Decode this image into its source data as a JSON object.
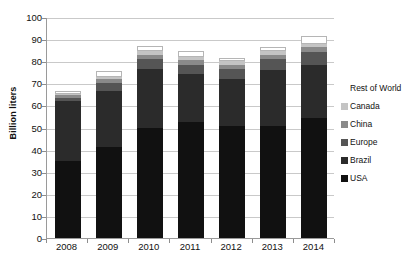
{
  "chart_data": {
    "type": "bar",
    "stacked": true,
    "title": "World Fuel Ethanol Production",
    "xlabel": "",
    "ylabel": "Billion liters",
    "categories": [
      "2008",
      "2009",
      "2010",
      "2011",
      "2012",
      "2013",
      "2014"
    ],
    "ylim": [
      0,
      100
    ],
    "ytick_step": 10,
    "yticks": [
      "0",
      "10",
      "20",
      "30",
      "40",
      "50",
      "60",
      "70",
      "80",
      "90",
      "100"
    ],
    "grid": true,
    "legend_position": "right",
    "series": [
      {
        "name": "USA",
        "color": "#111111",
        "values": [
          35.0,
          41.0,
          50.0,
          52.5,
          50.5,
          50.5,
          54.5
        ]
      },
      {
        "name": "Brazil",
        "color": "#2b2b2b",
        "values": [
          27.0,
          25.5,
          26.5,
          21.5,
          21.5,
          25.5,
          24.0
        ]
      },
      {
        "name": "Europe",
        "color": "#555555",
        "values": [
          1.5,
          3.5,
          4.5,
          4.5,
          4.5,
          5.0,
          5.5
        ]
      },
      {
        "name": "China",
        "color": "#8a8a8a",
        "values": [
          1.0,
          2.0,
          2.0,
          2.0,
          2.0,
          2.0,
          2.5
        ]
      },
      {
        "name": "Canada",
        "color": "#c4c4c4",
        "values": [
          0.8,
          1.0,
          1.5,
          1.5,
          1.5,
          1.5,
          1.5
        ]
      },
      {
        "name": "Rest of World",
        "color": "#ffffff",
        "values": [
          1.2,
          2.5,
          2.5,
          2.5,
          1.5,
          2.0,
          3.5
        ]
      }
    ],
    "totals": [
      66.5,
      75.5,
      87.0,
      84.5,
      81.5,
      86.5,
      91.5
    ]
  },
  "legend": {
    "items": [
      {
        "label": "Rest of World"
      },
      {
        "label": "Canada"
      },
      {
        "label": "China"
      },
      {
        "label": "Europe"
      },
      {
        "label": "Brazil"
      },
      {
        "label": "USA"
      }
    ]
  }
}
